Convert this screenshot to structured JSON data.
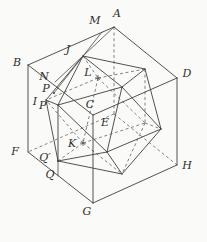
{
  "figure": {
    "type": "geometry-diagram",
    "canvas": {
      "width": 207,
      "height": 242,
      "background": "#fafaf8",
      "line_color": "#3f3f3f",
      "hidden_line_color": "#5a5a5a",
      "label_color": "#2e2e2e"
    },
    "points": {
      "A": [
        114,
        27
      ],
      "B": [
        28,
        65
      ],
      "C": [
        93,
        115
      ],
      "D": [
        177,
        78
      ],
      "E": [
        114,
        114
      ],
      "F": [
        28,
        152
      ],
      "G": [
        93,
        203
      ],
      "H": [
        177,
        165
      ],
      "J": [
        83,
        56
      ],
      "t2": [
        122,
        87
      ],
      "K": [
        83,
        143
      ],
      "b2": [
        122,
        174
      ],
      "L": [
        98,
        78
      ],
      "I": [
        46,
        100
      ],
      "k1": [
        145,
        69
      ],
      "k2": [
        145,
        123
      ],
      "Pp": [
        58,
        105
      ],
      "m2": [
        58,
        161
      ],
      "r1": [
        161,
        129
      ],
      "r2": [
        107,
        152
      ],
      "M": [
        102,
        32
      ],
      "N": [
        55,
        82
      ],
      "P": [
        54,
        93
      ],
      "Q": [
        58,
        176
      ]
    },
    "cube": {
      "solid_edges": [
        [
          "A",
          "B"
        ],
        [
          "A",
          "D"
        ],
        [
          "B",
          "C"
        ],
        [
          "C",
          "D"
        ],
        [
          "B",
          "F"
        ],
        [
          "C",
          "G"
        ],
        [
          "D",
          "H"
        ],
        [
          "F",
          "G"
        ],
        [
          "G",
          "H"
        ]
      ],
      "dashed_edges": [
        [
          "A",
          "E"
        ],
        [
          "E",
          "F"
        ],
        [
          "E",
          "H"
        ]
      ]
    },
    "icosahedron": {
      "solid_edges": [
        [
          "J",
          "t2"
        ],
        [
          "J",
          "k1"
        ],
        [
          "J",
          "Pp"
        ],
        [
          "J",
          "I"
        ],
        [
          "t2",
          "k1"
        ],
        [
          "t2",
          "Pp"
        ],
        [
          "t2",
          "r1"
        ],
        [
          "t2",
          "r2"
        ],
        [
          "k1",
          "r1"
        ],
        [
          "Pp",
          "r2"
        ],
        [
          "Pp",
          "I"
        ],
        [
          "Pp",
          "m2"
        ],
        [
          "r1",
          "r2"
        ],
        [
          "b2",
          "m2"
        ],
        [
          "b2",
          "r2"
        ],
        [
          "b2",
          "r1"
        ],
        [
          "m2",
          "r2"
        ],
        [
          "m2",
          "I"
        ]
      ],
      "dashed_edges": [
        [
          "J",
          "L"
        ],
        [
          "L",
          "K"
        ],
        [
          "L",
          "I"
        ],
        [
          "L",
          "k1"
        ],
        [
          "L",
          "k2"
        ],
        [
          "K",
          "b2"
        ],
        [
          "K",
          "k2"
        ],
        [
          "K",
          "I"
        ],
        [
          "K",
          "m2"
        ],
        [
          "k1",
          "k2"
        ],
        [
          "k2",
          "b2"
        ],
        [
          "k2",
          "r1"
        ]
      ]
    },
    "construction": {
      "solid_edges": [
        [
          "J",
          "M"
        ],
        [
          "J",
          "A"
        ],
        [
          "J",
          "N"
        ],
        [
          "J",
          "P"
        ],
        [
          "m2",
          "Q"
        ]
      ]
    },
    "labels": [
      {
        "text": "A",
        "point": "A",
        "x": 117,
        "y": 17
      },
      {
        "text": "M",
        "point": "M",
        "x": 95,
        "y": 24
      },
      {
        "text": "B",
        "point": "B",
        "x": 17,
        "y": 66
      },
      {
        "text": "J",
        "point": "J",
        "x": 68,
        "y": 53
      },
      {
        "text": "N",
        "point": "N",
        "x": 44,
        "y": 80
      },
      {
        "text": "L",
        "point": "L",
        "x": 88,
        "y": 76
      },
      {
        "text": "D",
        "point": "D",
        "x": 187,
        "y": 77
      },
      {
        "text": "P",
        "point": "P",
        "x": 46,
        "y": 92
      },
      {
        "text": "I",
        "point": "I",
        "x": 35,
        "y": 105
      },
      {
        "text": "P′",
        "point": "Pp",
        "x": 44,
        "y": 109
      },
      {
        "text": "C",
        "point": "C",
        "x": 90,
        "y": 108
      },
      {
        "text": "E",
        "point": "E",
        "x": 105,
        "y": 126
      },
      {
        "text": "K",
        "point": "K",
        "x": 72,
        "y": 147
      },
      {
        "text": "F",
        "point": "F",
        "x": 15,
        "y": 155
      },
      {
        "text": "Q′",
        "point": "m2",
        "x": 45,
        "y": 161
      },
      {
        "text": "Q",
        "point": "Q",
        "x": 50,
        "y": 178
      },
      {
        "text": "H",
        "point": "H",
        "x": 187,
        "y": 169
      },
      {
        "text": "G",
        "point": "G",
        "x": 87,
        "y": 215
      }
    ],
    "cross_marks": [
      {
        "point": "L"
      },
      {
        "point": "K"
      }
    ],
    "dot_marks": [
      {
        "point": "P"
      },
      {
        "point": "m2"
      }
    ]
  }
}
